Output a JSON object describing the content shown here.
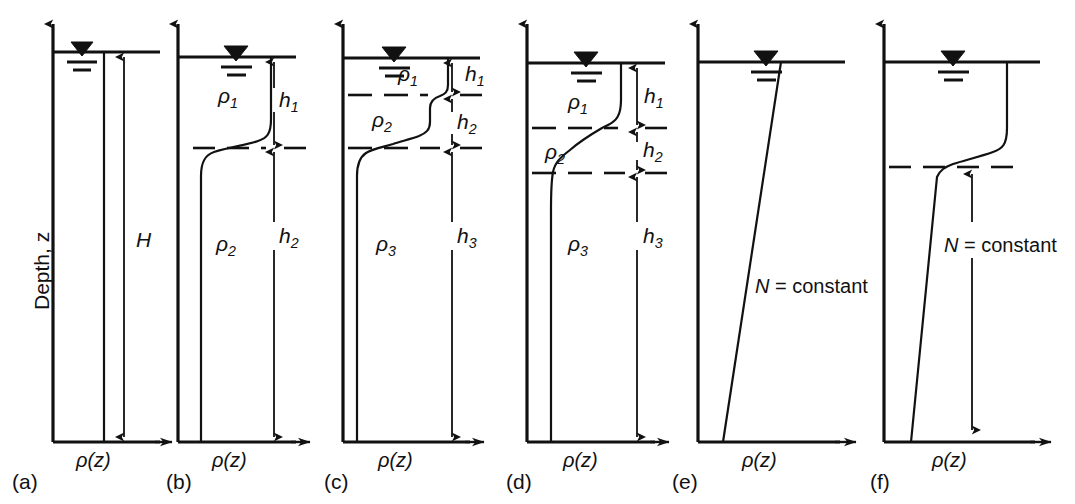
{
  "figure": {
    "type": "diagram",
    "axis_vertical_label": "Depth, z",
    "axis_horizontal_label": "ρ(z)",
    "surface_symbol": "free-water-surface-triangle"
  },
  "panels": [
    {
      "letter": "(a)",
      "caption_x": 38,
      "description": "Uniform (unstratified) density, total depth H",
      "axis_label": "ρ(z)",
      "dimension_labels": [
        {
          "text": "H",
          "sub": ""
        }
      ],
      "layer_labels": [],
      "n_constant_label": null
    },
    {
      "letter": "(b)",
      "caption_x": 193,
      "description": "Two-layer stratification with pycnocline",
      "axis_label": "ρ(z)",
      "dimension_labels": [
        {
          "text": "h",
          "sub": "1"
        },
        {
          "text": "h",
          "sub": "2"
        }
      ],
      "layer_labels": [
        {
          "text": "ρ",
          "sub": "1"
        },
        {
          "text": "ρ",
          "sub": "2"
        }
      ],
      "n_constant_label": null
    },
    {
      "letter": "(c)",
      "caption_x": 348,
      "description": "Three-layer stratification, thin upper layer",
      "axis_label": "ρ(z)",
      "dimension_labels": [
        {
          "text": "h",
          "sub": "1"
        },
        {
          "text": "h",
          "sub": "2"
        },
        {
          "text": "h",
          "sub": "3"
        }
      ],
      "layer_labels": [
        {
          "text": "ρ",
          "sub": "1"
        },
        {
          "text": "ρ",
          "sub": "2"
        },
        {
          "text": "ρ",
          "sub": "3"
        }
      ],
      "n_constant_label": null
    },
    {
      "letter": "(d)",
      "caption_x": 512,
      "description": "Three-layer stratification, thicker upper layer and diffuse interfaces",
      "axis_label": "ρ(z)",
      "dimension_labels": [
        {
          "text": "h",
          "sub": "1"
        },
        {
          "text": "h",
          "sub": "2"
        },
        {
          "text": "h",
          "sub": "3"
        }
      ],
      "layer_labels": [
        {
          "text": "ρ",
          "sub": "1"
        },
        {
          "text": "ρ",
          "sub": "2"
        },
        {
          "text": "ρ",
          "sub": "3"
        }
      ],
      "n_constant_label": null
    },
    {
      "letter": "(e)",
      "caption_x": 676,
      "description": "Linear density profile, constant buoyancy frequency",
      "axis_label": "ρ(z)",
      "dimension_labels": [],
      "layer_labels": [],
      "n_constant_label": "N = constant"
    },
    {
      "letter": "(f)",
      "caption_x": 874,
      "description": "Surface mixed layer above a linearly stratified region",
      "axis_label": "ρ(z)",
      "dimension_labels": [],
      "layer_labels": [],
      "n_constant_label": "N = constant"
    }
  ],
  "labels": {
    "depth": "Depth, z",
    "rho_of_z": "ρ(z)",
    "H": "H",
    "h1": "h",
    "h1_sub": "1",
    "h2": "h",
    "h2_sub": "2",
    "h3": "h",
    "h3_sub": "3",
    "rho1": "ρ",
    "rho1_sub": "1",
    "rho2": "ρ",
    "rho2_sub": "2",
    "rho3": "ρ",
    "rho3_sub": "3",
    "n_eq": "N",
    "n_rest": " = constant",
    "letter_a": "(a)",
    "letter_b": "(b)",
    "letter_c": "(c)",
    "letter_d": "(d)",
    "letter_e": "(e)",
    "letter_f": "(f)"
  },
  "colors": {
    "ink": "#111111",
    "background": "#ffffff"
  }
}
